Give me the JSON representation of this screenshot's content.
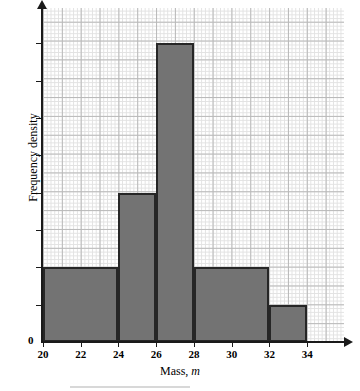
{
  "chart_data": {
    "type": "bar",
    "title": "",
    "subtitle": "",
    "xlabel": "Mass, m",
    "xlabel_text": "Mass,",
    "xlabel_var": "m",
    "ylabel": "Frequency density",
    "xlim": [
      20,
      35.95
    ],
    "ylim": [
      0,
      8.95
    ],
    "grid": true,
    "legend": null,
    "x_ticks": [
      20,
      22,
      24,
      26,
      28,
      30,
      32,
      34
    ],
    "x_tick_labels": [
      "20",
      "22",
      "24",
      "26",
      "28",
      "30",
      "32",
      "34"
    ],
    "y_ticks": [
      0,
      1,
      2,
      3,
      4,
      5,
      6,
      7,
      8
    ],
    "y_tick_labels": [
      "0",
      "",
      "",
      "",
      "",
      "",
      "",
      "",
      ""
    ],
    "y_origin_label": "0",
    "bars": [
      {
        "label": "20-24",
        "x_start": 20,
        "x_end": 24,
        "height": 2,
        "fill": "#737373",
        "stroke": "#262626"
      },
      {
        "label": "24-26",
        "x_start": 24,
        "x_end": 26,
        "height": 4,
        "fill": "#737373",
        "stroke": "#262626"
      },
      {
        "label": "26-28",
        "x_start": 26,
        "x_end": 28,
        "height": 8,
        "fill": "#737373",
        "stroke": "#262626"
      },
      {
        "label": "28-32",
        "x_start": 28,
        "x_end": 32,
        "height": 2,
        "fill": "#737373",
        "stroke": "#262626"
      },
      {
        "label": "32-34",
        "x_start": 32,
        "x_end": 34,
        "height": 1,
        "fill": "#737373",
        "stroke": "#262626"
      }
    ],
    "colors": {
      "bar_fill": "#737373",
      "bar_stroke": "#262626",
      "axis": "#1a1a1a",
      "grid_major": "#b9b9b9",
      "grid_minor": "#e2e2e2",
      "background": "#ffffff"
    }
  }
}
